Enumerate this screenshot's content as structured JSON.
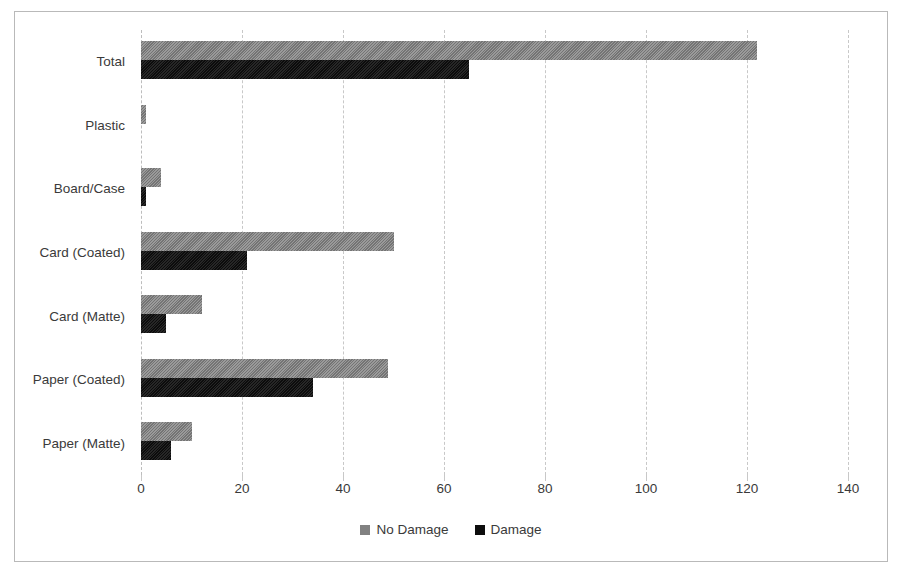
{
  "chart_data": {
    "type": "bar",
    "orientation": "horizontal",
    "title": "",
    "xlabel": "",
    "ylabel": "",
    "xlim": [
      0,
      140
    ],
    "xticks": [
      0,
      20,
      40,
      60,
      80,
      100,
      120,
      140
    ],
    "grid": true,
    "legend_position": "bottom",
    "categories": [
      "Total",
      "Plastic",
      "Board/Case",
      "Card (Coated)",
      "Card (Matte)",
      "Paper (Coated)",
      "Paper (Matte)"
    ],
    "series": [
      {
        "name": "No Damage",
        "color": "#818181",
        "values": [
          122,
          1,
          4,
          50,
          12,
          49,
          10
        ]
      },
      {
        "name": "Damage",
        "color": "#0e0e0e",
        "values": [
          65,
          0,
          1,
          21,
          5,
          34,
          6
        ]
      }
    ]
  },
  "legend": {
    "items": [
      {
        "label": "No Damage",
        "color": "#818181"
      },
      {
        "label": "Damage",
        "color": "#0e0e0e"
      }
    ]
  },
  "axis": {
    "tick_labels": [
      "0",
      "20",
      "40",
      "60",
      "80",
      "100",
      "120",
      "140"
    ]
  },
  "colors": {
    "no_damage": "#818181",
    "damage": "#0e0e0e",
    "gridline": "#c8c8c8",
    "border": "#b9b9b9",
    "text": "#3a3a3a",
    "background": "#ffffff"
  }
}
